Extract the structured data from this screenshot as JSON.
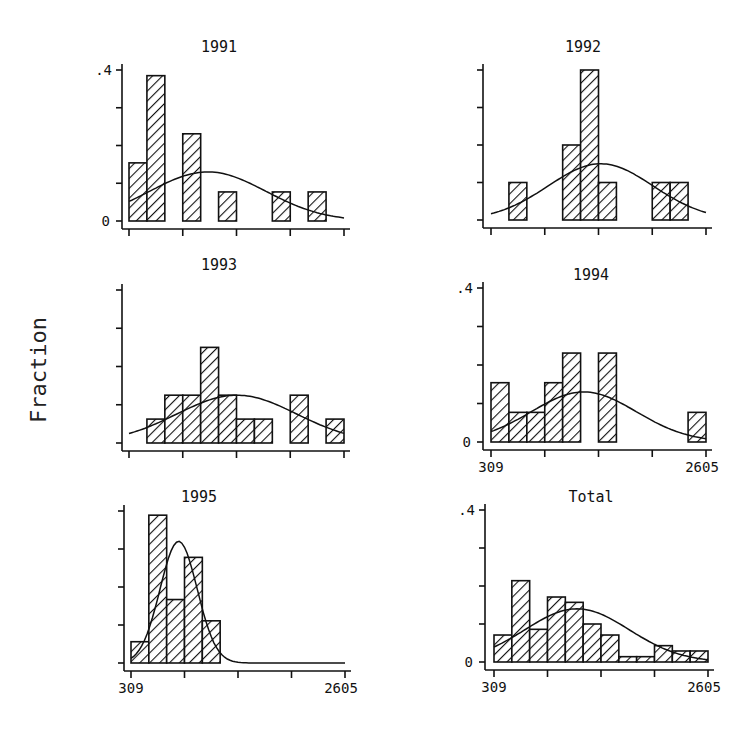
{
  "figure": {
    "y_axis_label": "Fraction",
    "x_min_label": "309",
    "x_max_label": "2605",
    "y_top_label": ".4",
    "y_zero_label": "0"
  },
  "chart_data": [
    {
      "type": "bar",
      "title": "1991",
      "xlabel": "",
      "ylabel": "Fraction",
      "xlim": [
        309,
        2605
      ],
      "ylim": [
        0,
        0.4
      ],
      "bins": 12,
      "bin_edges": [
        309,
        500.3,
        691.7,
        883,
        1074.3,
        1265.7,
        1457,
        1648.3,
        1839.7,
        2031,
        2222.3,
        2413.7,
        2605
      ],
      "values": [
        0.154,
        0.385,
        0,
        0.231,
        0,
        0.077,
        0,
        0,
        0.077,
        0,
        0.077,
        0
      ],
      "normal_curve": {
        "mean": 1150,
        "sd": 620,
        "peak": 0.13
      },
      "y_tick_labels": [
        ".4",
        "0"
      ],
      "x_tick_labels": []
    },
    {
      "type": "bar",
      "title": "1992",
      "xlabel": "",
      "ylabel": "Fraction",
      "xlim": [
        309,
        2605
      ],
      "ylim": [
        0,
        0.4
      ],
      "bins": 12,
      "values": [
        0,
        0.1,
        0,
        0,
        0.2,
        0.4,
        0.1,
        0,
        0,
        0.1,
        0.1,
        0
      ],
      "normal_curve": {
        "mean": 1480,
        "sd": 560,
        "peak": 0.15
      },
      "y_tick_labels": [],
      "x_tick_labels": []
    },
    {
      "type": "bar",
      "title": "1993",
      "xlabel": "",
      "ylabel": "Fraction",
      "xlim": [
        309,
        2605
      ],
      "ylim": [
        0,
        0.4
      ],
      "bins": 12,
      "values": [
        0,
        0.0625,
        0.125,
        0.125,
        0.25,
        0.125,
        0.0625,
        0.0625,
        0,
        0.125,
        0,
        0.0625
      ],
      "normal_curve": {
        "mean": 1460,
        "sd": 640,
        "peak": 0.125
      },
      "y_tick_labels": [],
      "x_tick_labels": []
    },
    {
      "type": "bar",
      "title": "1994",
      "xlabel": "",
      "ylabel": "Fraction",
      "xlim": [
        309,
        2605
      ],
      "ylim": [
        0,
        0.4
      ],
      "bins": 12,
      "values": [
        0.154,
        0.077,
        0.077,
        0.154,
        0.231,
        0,
        0.231,
        0,
        0,
        0,
        0,
        0.077
      ],
      "normal_curve": {
        "mean": 1300,
        "sd": 560,
        "peak": 0.13
      },
      "y_tick_labels": [
        ".4",
        "0"
      ],
      "x_tick_labels": [
        "309",
        "2605"
      ]
    },
    {
      "type": "bar",
      "title": "1995",
      "xlabel": "",
      "ylabel": "Fraction",
      "xlim": [
        309,
        2605
      ],
      "ylim": [
        0,
        0.4
      ],
      "bins": 12,
      "values": [
        0.056,
        0.389,
        0.167,
        0.278,
        0.111,
        0,
        0,
        0,
        0,
        0,
        0,
        0
      ],
      "normal_curve": {
        "mean": 820,
        "sd": 200,
        "peak": 0.32
      },
      "y_tick_labels": [],
      "x_tick_labels": [
        "309",
        "2605"
      ]
    },
    {
      "type": "bar",
      "title": "Total",
      "xlabel": "",
      "ylabel": "Fraction",
      "xlim": [
        309,
        2605
      ],
      "ylim": [
        0,
        0.4
      ],
      "bins": 12,
      "values": [
        0.071,
        0.214,
        0.086,
        0.171,
        0.157,
        0.1,
        0.071,
        0.014,
        0.014,
        0.043,
        0.029,
        0.029
      ],
      "normal_curve": {
        "mean": 1200,
        "sd": 560,
        "peak": 0.14
      },
      "y_tick_labels": [
        ".4",
        "0"
      ],
      "x_tick_labels": [
        "309",
        "2605"
      ]
    }
  ]
}
